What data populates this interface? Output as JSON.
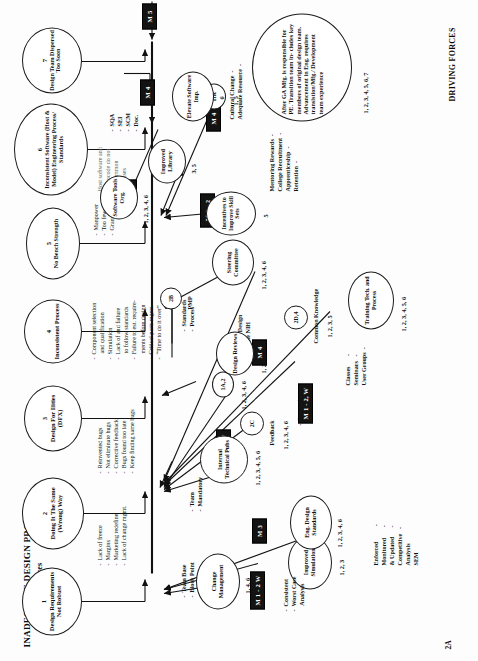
{
  "meta": {
    "page_tag": "2A",
    "title": "INADEQUATE DESIGN PROCESS",
    "subtitle": "Restraining Forces",
    "driving_forces_label": "DRIVING FORCES"
  },
  "restraining_forces": [
    {
      "num": "1",
      "label": "Design Requirements\nNot Robust",
      "bullets": "-  Lack of freeze\n-  Margins\n-  Marketing redefine\n-  Lack of change mgmt."
    },
    {
      "num": "2",
      "label": "Doing It The Same\n(Wrong) Way",
      "bullets": "-  Reinvented bugs\n-  Not eliminate bugs\n-  Corrective feedback\n-  Bugs found too late\n-  Keep finding same bugs"
    },
    {
      "num": "3",
      "label": "Design For\nIlities (DFX)",
      "bullets": ""
    },
    {
      "num": "4",
      "label": "Inconsistent\nProcess",
      "bullets": "-  Component selection\n    and qualification\n-  Simulation\n-  Lack of and failure\n    to follow standards\n-  Failure to est. require-\n    ments before design\n-  Critical parts mgmt.\n-  “Time to do it over”"
    },
    {
      "num": "5",
      "label": "No Bench Strength",
      "bullets": "-  Manpower\n-  Too few\n-  Grand wizards"
    },
    {
      "num": "6",
      "label": "Inconsistent Software\n(Host & Model)\nEngineering Process/\nStandards",
      "bullets": "Host software and\nmicrocode do not\nuse common\nprocesses"
    },
    {
      "num": "7",
      "label": "Design Team\nDispersed Too\nSoon",
      "bullets": ""
    }
  ],
  "mboxes": [
    {
      "id": "m1",
      "label": "M 1 - 2 W"
    },
    {
      "id": "m2",
      "label": "M 3"
    },
    {
      "id": "m3",
      "label": "M 3"
    },
    {
      "id": "m4",
      "label": "M 1 - 2, W"
    },
    {
      "id": "m5",
      "label": "M 1 - 2 W"
    },
    {
      "id": "m6",
      "label": "M 4"
    },
    {
      "id": "m7",
      "label": "M 1 - 2"
    },
    {
      "id": "m8",
      "label": "M 4"
    },
    {
      "id": "m9",
      "label": "M 3"
    },
    {
      "id": "m10",
      "label": "M 4"
    },
    {
      "id": "m11",
      "label": "M 4"
    },
    {
      "id": "m12",
      "label": "M 5"
    }
  ],
  "driving_nodes": [
    {
      "id": "d_improved_sim",
      "label": "Improved\nSimulation",
      "nums": "1, 2, 3",
      "bullets": "-  Consistent\n-  Worst Case\n    Analysis"
    },
    {
      "id": "d_change_mgmt",
      "label": "Change\nManagement",
      "nums": "1, 4, 6",
      "bullets": ""
    },
    {
      "id": "d_eng_design_std",
      "label": "Eng. Design\nStandards",
      "nums": "1, 2, 3, 4, 6",
      "bullets": "Enforced          -\nMonitored       -\n& Updated      -\nCompetitive   -\nAnalysis\nSEM"
    },
    {
      "id": "d_internal_pubs",
      "label": "Internal\nTechnical\nPubs",
      "nums": "1, 2, 3, 4, 5, 6",
      "bullets": ""
    },
    {
      "id": "d_2c",
      "label": "2C",
      "nums": "1, 2, 3, 4, 6",
      "bullets": "Feedback"
    },
    {
      "id": "d_1a2",
      "label": "1A,2",
      "nums": "1, 2, 3, 4, 6",
      "bullets": ""
    },
    {
      "id": "d_design_reviews",
      "label": "Design\nReviews",
      "nums": "1, 2, 3, 6",
      "bullets": ""
    },
    {
      "id": "d_2b",
      "label": "2B",
      "nums": "",
      "bullets": "PMP"
    },
    {
      "id": "d_2d4",
      "label": "2D,4",
      "nums": "1, 2, 3, 5",
      "bullets": "Common Knowledge"
    },
    {
      "id": "d_training",
      "label": "Training Tech.\nand Process",
      "nums": "1, 2, 3, 4, 5, 6",
      "bullets": "Classes       -\nSeminars   -\nUser Groups  -"
    },
    {
      "id": "d_steering",
      "label": "Steering\nCommittee",
      "nums": "1, 2, 3, 4, 6",
      "bullets": "-  Standards\n-  Process"
    },
    {
      "id": "d_incentives",
      "label": "Incentives\nto Improve\nSkill Sets",
      "nums": "5",
      "bullets": ""
    },
    {
      "id": "d_hr",
      "label": "HR",
      "nums": "1, 5",
      "bullets": "Mentoring Rewards  -\nCollege Recruitment  -\nApprenticeship  -\nRetention  -"
    },
    {
      "id": "d_improved_library",
      "label": "Improved\nLibrary",
      "nums": "3, 5",
      "bullets": ""
    },
    {
      "id": "d_software_tools",
      "label": "Software\nTools Org.",
      "nums": "1, 2, 3, 4, 6",
      "bullets": ""
    },
    {
      "id": "d_elevate_sw",
      "label": "Elevate\nSoftware Imp.",
      "nums": "6",
      "bullets": "-  SQA\n-  SEI\n-  SCM\n-  Doc."
    },
    {
      "id": "d_ga_mfg",
      "label": "After GA Mfg. is responsible\nfor PE.  Transition team in-\ncludes key members of original\ndesign team.   Advancement in\nEng. requires  transistion/Mfg./\nDevelopment team experience",
      "nums": "1, 2, 3, 4, 5, 6, 7",
      "bullets": "Cultural Change  -\nAdequate Resource  -"
    }
  ],
  "center_annotations": [
    {
      "id": "a_team_base",
      "text": "-  Team Base\n-  Block Point"
    },
    {
      "id": "a_rewards",
      "text": "-  Rewards"
    },
    {
      "id": "a_team_mandatory",
      "text": "-  Team\n-  Mandatory"
    },
    {
      "id": "a_successful",
      "text": "-  Successful Design\n-  Eliminate NIH"
    }
  ]
}
